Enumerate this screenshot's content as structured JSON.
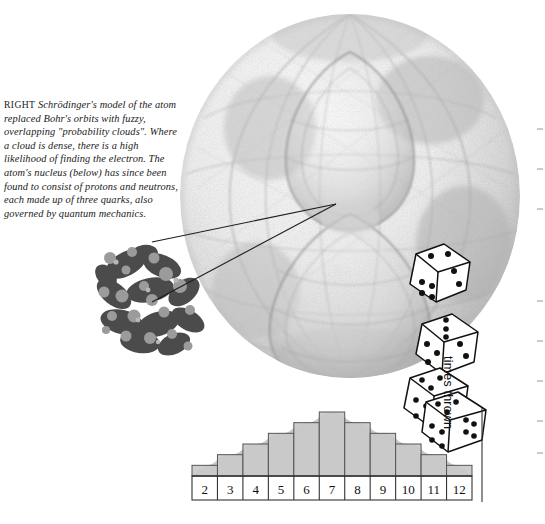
{
  "page": {
    "background": "#ffffff"
  },
  "caption": {
    "lead": "RIGHT",
    "text": " Schrödinger's model of the atom replaced Bohr's orbits with fuzzy, overlapping \"probability clouds\". Where a cloud is dense, there is a high likelihood of finding the electron. The atom's nucleus (below) has since been found to consist of protons and neutrons, each made up of three quarks, also governed by quantum mechanics."
  },
  "figure": {
    "atom_label": "schrodinger-atom-probability-cloud",
    "nucleus_label": "atomic-nucleus-quark-cluster",
    "leader_lines": 2,
    "sketch_color": "#8f8f8f",
    "nucleus_color": "#4a4a4a",
    "quark_color": "#9a9a9a"
  },
  "dice": {
    "count": 4,
    "faces": [
      {
        "top": 3,
        "left": 4,
        "right": 2
      },
      {
        "top": 3,
        "left": 4,
        "right": 2
      },
      {
        "top": 5,
        "left": 4,
        "right": 3
      },
      {
        "top": 5,
        "left": 4,
        "right": 6
      }
    ],
    "pip_color": "#111111",
    "body_color": "#ffffff"
  },
  "chart_data": {
    "type": "bar",
    "title": "",
    "xlabel": "",
    "ylabel": "times thrown",
    "categories": [
      "2",
      "3",
      "4",
      "5",
      "6",
      "7",
      "8",
      "9",
      "10",
      "11",
      "12"
    ],
    "values": [
      1,
      2,
      3,
      4,
      5,
      6,
      5,
      4,
      3,
      2,
      1
    ],
    "ylim": [
      0,
      6
    ],
    "grid": false,
    "legend": null,
    "bar_fill": "#c9c9c9",
    "bar_stroke": "#555555",
    "curve_fill": "#bdbdbd",
    "axis_color": "#333333",
    "note": "distribution of the sum of two thrown dice; smooth bell-shaped envelope drawn behind the bars"
  }
}
